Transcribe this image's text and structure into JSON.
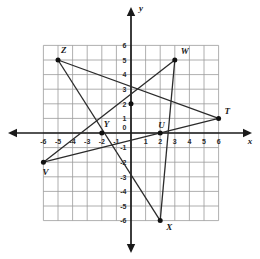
{
  "figure": {
    "axis_x_label": "x",
    "axis_y_label": "y",
    "x_ticks": [
      "-6",
      "-5",
      "-4",
      "-3",
      "-2",
      "-1",
      "1",
      "2",
      "3",
      "4",
      "5",
      "6"
    ],
    "y_ticks": [
      "6",
      "5",
      "4",
      "3",
      "2",
      "1",
      "0",
      "-1",
      "-2",
      "-3",
      "-4",
      "-5",
      "-6"
    ],
    "origin_label": "0"
  },
  "chart_data": {
    "type": "scatter",
    "title": "",
    "xlabel": "x",
    "ylabel": "y",
    "xlim": [
      -6,
      6
    ],
    "ylim": [
      -6,
      6
    ],
    "grid": true,
    "legend": "none",
    "x_tick_values": [
      -6,
      -5,
      -4,
      -3,
      -2,
      -1,
      1,
      2,
      3,
      4,
      5,
      6
    ],
    "y_tick_values": [
      6,
      5,
      4,
      3,
      2,
      1,
      0,
      -1,
      -2,
      -3,
      -4,
      -5,
      -6
    ],
    "points": [
      {
        "label": "T",
        "x": 6,
        "y": 1,
        "label_dx": 6,
        "label_dy": -4
      },
      {
        "label": "U",
        "x": 2,
        "y": 0,
        "label_dx": -2,
        "label_dy": -5
      },
      {
        "label": "V",
        "x": -6,
        "y": -2,
        "label_dx": -1,
        "label_dy": 13
      },
      {
        "label": "W",
        "x": 3,
        "y": 5,
        "label_dx": 6,
        "label_dy": -6
      },
      {
        "label": "X",
        "x": 2,
        "y": -6,
        "label_dx": 6,
        "label_dy": 9
      },
      {
        "label": "Y",
        "x": -2,
        "y": 0,
        "label_dx": 2,
        "label_dy": -6
      },
      {
        "label": "Z",
        "x": -5,
        "y": 5,
        "label_dx": 3,
        "label_dy": -7
      },
      {
        "label": "",
        "x": 0,
        "y": 2,
        "label_dx": 0,
        "label_dy": 0
      }
    ],
    "segments": [
      {
        "name": "Z-T",
        "from": [
          -5,
          5
        ],
        "to": [
          6,
          1
        ]
      },
      {
        "name": "Z-X",
        "from": [
          -5,
          5
        ],
        "to": [
          2,
          -6
        ]
      },
      {
        "name": "V-W",
        "from": [
          -6,
          -2
        ],
        "to": [
          3,
          5
        ]
      },
      {
        "name": "V-T",
        "from": [
          -6,
          -2
        ],
        "to": [
          6,
          1
        ]
      },
      {
        "name": "W-X",
        "from": [
          3,
          5
        ],
        "to": [
          2,
          -6
        ]
      }
    ],
    "colors": {
      "grid": "#9a9a9a",
      "axis": "#1a1a1a",
      "segment": "#2b2b2b",
      "point": "#111111",
      "background": "#ffffff"
    }
  }
}
